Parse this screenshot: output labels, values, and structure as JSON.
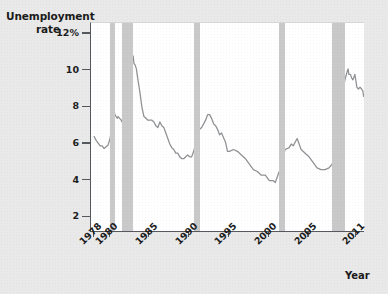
{
  "title": {
    "line1": "Unemployment",
    "line2": "rate"
  },
  "axes": {
    "x_name": "Year",
    "y_ticks": [
      {
        "value": 12,
        "label": "12%"
      },
      {
        "value": 10,
        "label": "10"
      },
      {
        "value": 8,
        "label": "8"
      },
      {
        "value": 6,
        "label": "6"
      },
      {
        "value": 4,
        "label": "4"
      },
      {
        "value": 2,
        "label": "2"
      }
    ],
    "x_ticks": [
      {
        "value": 1978,
        "label": "1978"
      },
      {
        "value": 1980,
        "label": "1980"
      },
      {
        "value": 1985,
        "label": "1985"
      },
      {
        "value": 1990,
        "label": "1990"
      },
      {
        "value": 1995,
        "label": "1995"
      },
      {
        "value": 2000,
        "label": "2000"
      },
      {
        "value": 2005,
        "label": "2005"
      },
      {
        "value": 2011,
        "label": "2011"
      }
    ]
  },
  "colors": {
    "line": "#8f9194",
    "recession_band": "#c9c9c9",
    "plot_background": "#ffffff",
    "page_background": "#e9e9e9",
    "axis": "#55585c",
    "text": "#1b1b1b"
  },
  "chart_data": {
    "type": "line",
    "title": "Unemployment rate",
    "xlabel": "Year",
    "ylabel": "Unemployment rate",
    "xlim": [
      1977.6,
      2011.9
    ],
    "ylim": [
      1.2,
      12.6
    ],
    "grid": false,
    "legend": null,
    "units": "percent",
    "series": [
      {
        "name": "Unemployment rate",
        "color": "#8f9194",
        "points": [
          [
            1978.0,
            6.4
          ],
          [
            1978.25,
            6.2
          ],
          [
            1978.5,
            6.05
          ],
          [
            1978.75,
            5.9
          ],
          [
            1979.0,
            5.9
          ],
          [
            1979.25,
            5.75
          ],
          [
            1979.5,
            5.85
          ],
          [
            1979.75,
            5.95
          ],
          [
            1980.0,
            6.3
          ],
          [
            1980.2,
            6.9
          ],
          [
            1980.35,
            7.5
          ],
          [
            1980.5,
            7.8
          ],
          [
            1980.6,
            7.6
          ],
          [
            1980.75,
            7.5
          ],
          [
            1980.9,
            7.4
          ],
          [
            1981.0,
            7.5
          ],
          [
            1981.2,
            7.4
          ],
          [
            1981.4,
            7.3
          ],
          [
            1981.5,
            7.2
          ],
          [
            1981.6,
            7.4
          ],
          [
            1981.8,
            8.0
          ],
          [
            1982.0,
            8.6
          ],
          [
            1982.25,
            9.4
          ],
          [
            1982.5,
            9.8
          ],
          [
            1982.75,
            10.4
          ],
          [
            1982.9,
            10.8
          ],
          [
            1983.0,
            10.4
          ],
          [
            1983.15,
            10.3
          ],
          [
            1983.3,
            10.1
          ],
          [
            1983.5,
            9.5
          ],
          [
            1983.75,
            8.8
          ],
          [
            1984.0,
            8.0
          ],
          [
            1984.25,
            7.5
          ],
          [
            1984.5,
            7.4
          ],
          [
            1984.75,
            7.3
          ],
          [
            1985.0,
            7.3
          ],
          [
            1985.25,
            7.3
          ],
          [
            1985.5,
            7.2
          ],
          [
            1985.75,
            7.0
          ],
          [
            1986.0,
            6.9
          ],
          [
            1986.25,
            7.2
          ],
          [
            1986.5,
            7.0
          ],
          [
            1986.75,
            6.9
          ],
          [
            1987.0,
            6.6
          ],
          [
            1987.25,
            6.3
          ],
          [
            1987.5,
            6.0
          ],
          [
            1987.75,
            5.8
          ],
          [
            1988.0,
            5.7
          ],
          [
            1988.25,
            5.5
          ],
          [
            1988.5,
            5.5
          ],
          [
            1988.75,
            5.3
          ],
          [
            1989.0,
            5.2
          ],
          [
            1989.25,
            5.2
          ],
          [
            1989.5,
            5.3
          ],
          [
            1989.75,
            5.4
          ],
          [
            1990.0,
            5.3
          ],
          [
            1990.25,
            5.3
          ],
          [
            1990.5,
            5.6
          ],
          [
            1990.75,
            6.0
          ],
          [
            1991.0,
            6.5
          ],
          [
            1991.25,
            6.8
          ],
          [
            1991.5,
            6.9
          ],
          [
            1991.75,
            7.1
          ],
          [
            1992.0,
            7.3
          ],
          [
            1992.25,
            7.6
          ],
          [
            1992.5,
            7.6
          ],
          [
            1992.75,
            7.4
          ],
          [
            1993.0,
            7.1
          ],
          [
            1993.25,
            7.0
          ],
          [
            1993.5,
            6.8
          ],
          [
            1993.75,
            6.5
          ],
          [
            1994.0,
            6.6
          ],
          [
            1994.5,
            6.1
          ],
          [
            1994.75,
            5.6
          ],
          [
            1995.0,
            5.6
          ],
          [
            1995.5,
            5.7
          ],
          [
            1996.0,
            5.6
          ],
          [
            1996.5,
            5.4
          ],
          [
            1997.0,
            5.2
          ],
          [
            1997.5,
            4.9
          ],
          [
            1998.0,
            4.6
          ],
          [
            1998.5,
            4.5
          ],
          [
            1999.0,
            4.3
          ],
          [
            1999.5,
            4.3
          ],
          [
            2000.0,
            4.0
          ],
          [
            2000.5,
            4.0
          ],
          [
            2000.75,
            3.9
          ],
          [
            2001.0,
            4.2
          ],
          [
            2001.25,
            4.5
          ],
          [
            2001.5,
            4.6
          ],
          [
            2001.75,
            5.4
          ],
          [
            2002.0,
            5.7
          ],
          [
            2002.5,
            5.8
          ],
          [
            2002.75,
            6.0
          ],
          [
            2003.0,
            5.9
          ],
          [
            2003.5,
            6.3
          ],
          [
            2003.75,
            6.0
          ],
          [
            2004.0,
            5.7
          ],
          [
            2004.5,
            5.5
          ],
          [
            2005.0,
            5.3
          ],
          [
            2005.5,
            5.0
          ],
          [
            2006.0,
            4.7
          ],
          [
            2006.5,
            4.6
          ],
          [
            2007.0,
            4.6
          ],
          [
            2007.5,
            4.7
          ],
          [
            2007.9,
            4.9
          ],
          [
            2008.0,
            5.0
          ],
          [
            2008.25,
            5.1
          ],
          [
            2008.5,
            5.8
          ],
          [
            2008.75,
            6.5
          ],
          [
            2009.0,
            7.8
          ],
          [
            2009.25,
            8.9
          ],
          [
            2009.5,
            9.5
          ],
          [
            2009.75,
            9.9
          ],
          [
            2009.9,
            10.1
          ],
          [
            2010.0,
            9.8
          ],
          [
            2010.2,
            9.8
          ],
          [
            2010.35,
            9.6
          ],
          [
            2010.5,
            9.5
          ],
          [
            2010.6,
            9.6
          ],
          [
            2010.75,
            9.8
          ],
          [
            2010.9,
            9.4
          ],
          [
            2011.0,
            9.1
          ],
          [
            2011.2,
            9.0
          ],
          [
            2011.4,
            9.1
          ],
          [
            2011.6,
            9.0
          ],
          [
            2011.75,
            8.9
          ],
          [
            2011.85,
            8.6
          ]
        ]
      }
    ],
    "annotations": {
      "recessions": [
        {
          "label": "1980 recession",
          "start": 1980.0,
          "end": 1980.58
        },
        {
          "label": "1981-82 recession",
          "start": 1981.5,
          "end": 1982.92
        },
        {
          "label": "1990-91 recession",
          "start": 1990.5,
          "end": 1991.25
        },
        {
          "label": "2001 recession",
          "start": 2001.25,
          "end": 2001.92
        },
        {
          "label": "2007-09 recession",
          "start": 2007.92,
          "end": 2009.5
        }
      ]
    }
  }
}
